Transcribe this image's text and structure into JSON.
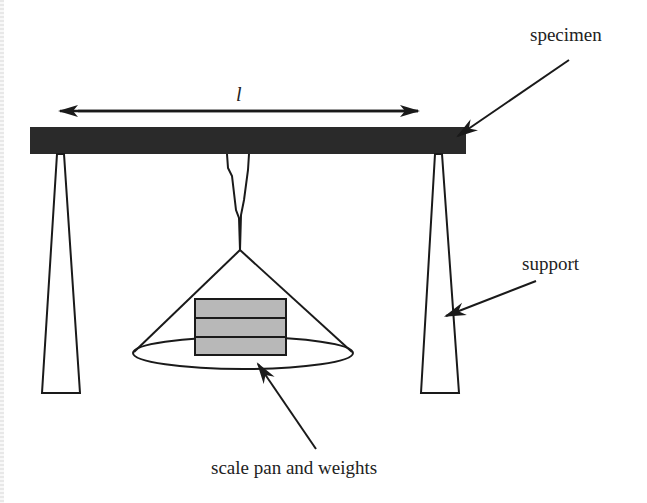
{
  "diagram": {
    "labels": {
      "length": "l",
      "specimen": "specimen",
      "support": "support",
      "scale_pan": "scale pan and weights"
    },
    "colors": {
      "specimen_fill": "#2a2a2a",
      "weight_fill": "#b8b8b8",
      "line": "#1a1a1a"
    },
    "components": [
      "specimen beam",
      "left support",
      "right support",
      "hanger",
      "scale pan",
      "weights (3 blocks)",
      "length dimension arrow"
    ]
  }
}
